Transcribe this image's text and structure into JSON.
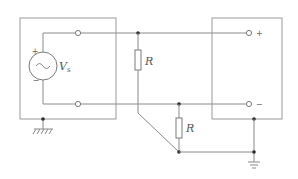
{
  "diagram": {
    "type": "circuit-schematic",
    "source": {
      "symbol": "ac-voltage-source",
      "label": "V",
      "subscript": "s",
      "plus_sign": "+",
      "minus_sign": "−"
    },
    "resistors": [
      {
        "id": "R1",
        "label": "R"
      },
      {
        "id": "R2",
        "label": "R"
      }
    ],
    "load_terminals": {
      "plus": "+",
      "minus": "−"
    },
    "grounds": [
      "chassis-ground-left",
      "signal-ground-right"
    ],
    "colors": {
      "wire": "#8a8a8a",
      "box": "#9a9a9a",
      "junction": "#2a2a2a",
      "label": "#555555"
    }
  }
}
